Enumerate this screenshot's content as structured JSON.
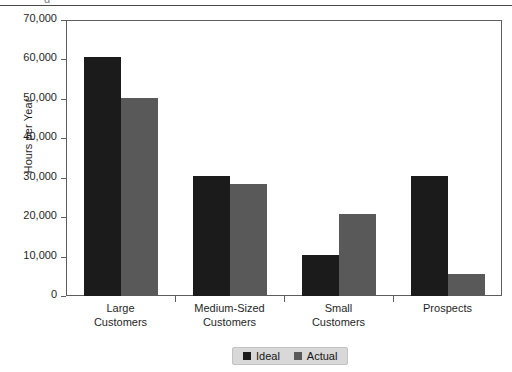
{
  "page": {
    "clipped_top_text": "g"
  },
  "chart_data": {
    "type": "bar",
    "title": "",
    "xlabel": "",
    "ylabel": "Hours per Year",
    "ylim": [
      0,
      70000
    ],
    "ytick_values": [
      70000,
      60000,
      50000,
      40000,
      30000,
      20000,
      10000,
      0
    ],
    "ytick_labels": [
      "70,000",
      "60,000",
      "50,000",
      "40,000",
      "30,000",
      "20,000",
      "10,000",
      "0"
    ],
    "grid": false,
    "legend_position": "bottom-center",
    "categories": [
      "Large\nCustomers",
      "Medium-Sized\nCustomers",
      "Small\nCustomers",
      "Prospects"
    ],
    "category_lines": [
      [
        "Large",
        "Customers"
      ],
      [
        "Medium-Sized",
        "Customers"
      ],
      [
        "Small",
        "Customers"
      ],
      [
        "Prospects",
        ""
      ]
    ],
    "series": [
      {
        "name": "Ideal",
        "color": "#1b1b1b",
        "values": [
          60500,
          30500,
          10500,
          30500
        ]
      },
      {
        "name": "Actual",
        "color": "#595959",
        "values": [
          50200,
          28500,
          20700,
          5500
        ]
      }
    ]
  },
  "colors": {
    "axis": "#5d5d5d",
    "text": "#1f1f1f",
    "legend_background": "#d8d8d8",
    "series_ideal": "#1b1b1b",
    "series_actual": "#595959"
  }
}
